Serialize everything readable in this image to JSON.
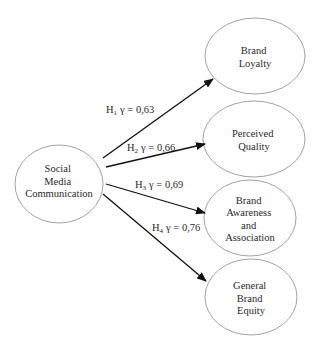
{
  "diagram": {
    "source": {
      "id": "smc",
      "lines": [
        "Social",
        "Media",
        "Communication"
      ]
    },
    "targets": [
      {
        "id": "bl",
        "lines": [
          "Brand",
          "Loyalty"
        ]
      },
      {
        "id": "pq",
        "lines": [
          "Perceived",
          "Quality"
        ]
      },
      {
        "id": "baa",
        "lines": [
          "Brand",
          "Awareness",
          "and",
          "Association"
        ]
      },
      {
        "id": "gbe",
        "lines": [
          "General",
          "Brand",
          "Equity"
        ]
      }
    ],
    "edges": [
      {
        "from": "smc",
        "to": "bl",
        "hypothesis": "H",
        "sub": "1",
        "coef_label": "γ = 0,63",
        "gamma": 0.63
      },
      {
        "from": "smc",
        "to": "pq",
        "hypothesis": "H",
        "sub": "2",
        "coef_label": "γ = 0,66",
        "gamma": 0.66
      },
      {
        "from": "smc",
        "to": "baa",
        "hypothesis": "H",
        "sub": "3",
        "coef_label": "γ = 0,69",
        "gamma": 0.69
      },
      {
        "from": "smc",
        "to": "gbe",
        "hypothesis": "H",
        "sub": "4",
        "coef_label": "γ = 0,76",
        "gamma": 0.76
      }
    ],
    "colors": {
      "stroke": "#8a8a8a",
      "arrow": "#111111",
      "text": "#2a2a2a"
    }
  }
}
